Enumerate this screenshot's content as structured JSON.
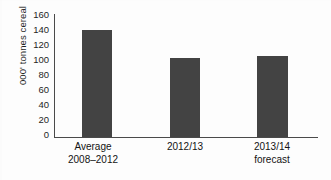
{
  "chart_data": {
    "type": "bar",
    "title": "",
    "xlabel": "",
    "ylabel": "000' tonnes cereal",
    "categories": [
      "Average 2008–2012",
      "2012/13",
      "2013/14 forecast"
    ],
    "category_lines": [
      [
        "Average",
        "2008–2012"
      ],
      [
        "2012/13",
        ""
      ],
      [
        "2013/14",
        "forecast"
      ]
    ],
    "values": [
      139,
      103,
      106
    ],
    "ylim": [
      0,
      160
    ],
    "ytick_step": 20,
    "yticks": [
      "160",
      "140",
      "120",
      "100",
      "80",
      "60",
      "40",
      "20",
      "0"
    ],
    "ytick_values": [
      160,
      140,
      120,
      100,
      80,
      60,
      40,
      20,
      0
    ],
    "grid": false,
    "legend": false,
    "legend_position": "none",
    "bar_color": "#434343",
    "axis_color": "#4a4a4a",
    "background_color": "#fdfdfd"
  }
}
